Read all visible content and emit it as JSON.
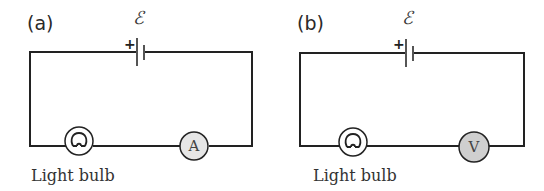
{
  "circuits": [
    {
      "panel_label": "(a)",
      "emf_symbol": "ℰ",
      "battery_positive": "+",
      "bulb_label": "Light bulb",
      "meter_letter": "A",
      "meter_type": "ammeter",
      "meter_fill": "#e6e6e6"
    },
    {
      "panel_label": "(b)",
      "emf_symbol": "ℰ",
      "battery_positive": "+",
      "bulb_label": "Light bulb",
      "meter_letter": "V",
      "meter_type": "voltmeter",
      "meter_fill": "#cfcfcf"
    }
  ]
}
